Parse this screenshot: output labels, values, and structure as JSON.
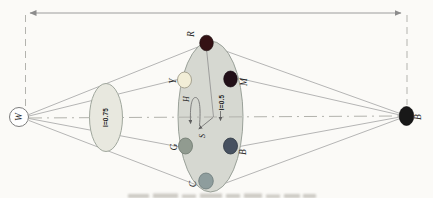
{
  "figure": {
    "kind": "HSI color model double-cone diagram (rotated sideways)",
    "labels": {
      "white_point": "W",
      "black_point": "B",
      "red": "R",
      "yellow": "Y",
      "green": "G",
      "cyan": "C",
      "blue": "B",
      "magenta": "M",
      "hue": "H",
      "saturation": "S",
      "intensity_mid_plane": "I=0.5",
      "intensity_upper_plane": "I=0.75"
    },
    "colors": {
      "background": "#fbfaf7",
      "line": "#adadad",
      "ellipse_mid_fill": "#d6d8d1",
      "ellipse_upper_fill": "#e8e8df",
      "white_point_fill": "#ffffff",
      "dot_red": "#341114",
      "dot_magenta": "#221018",
      "dot_yellow": "#f2eed7",
      "dot_green": "#919b90",
      "dot_blue": "#475160",
      "dot_cyan": "#8e9d9d",
      "black_point": "#181818",
      "label": "#1f1f1f"
    }
  }
}
